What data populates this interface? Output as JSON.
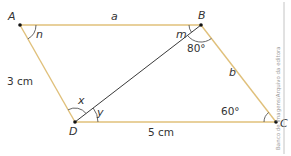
{
  "figure": {
    "type": "parallelogram",
    "colors": {
      "side": "#e0c07a",
      "diagonal": "#3a3a3a",
      "vertex": "#111111",
      "arc": "#555555",
      "credit_rule": "#b5b5b5"
    },
    "vertices": {
      "A": {
        "label": "A",
        "x": 20,
        "y": 25
      },
      "B": {
        "label": "B",
        "x": 201,
        "y": 25
      },
      "C": {
        "label": "C",
        "x": 276,
        "y": 122
      },
      "D": {
        "label": "D",
        "x": 75,
        "y": 122
      }
    },
    "sides": {
      "AB": {
        "label": "a"
      },
      "BC": {
        "label": "b"
      },
      "DC": {
        "label": "5 cm"
      },
      "AD": {
        "label": "3 cm"
      }
    },
    "diagonal": {
      "from": "B",
      "to": "D"
    },
    "angles": {
      "A": {
        "label": "n"
      },
      "B_left": {
        "label": "m"
      },
      "B_right": {
        "label": "80°"
      },
      "C": {
        "label": "60°"
      },
      "D_left": {
        "label": "x"
      },
      "D_right": {
        "label": "y"
      }
    }
  },
  "credit": "Banco de imagens/Arquivo da editora"
}
